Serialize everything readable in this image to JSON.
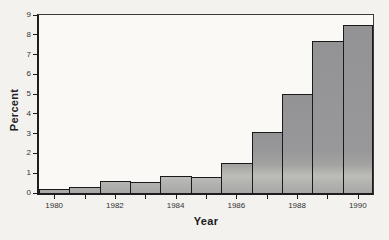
{
  "chart_data": {
    "type": "bar",
    "title": "",
    "xlabel": "Year",
    "ylabel": "Percent",
    "categories": [
      "1980",
      "1981",
      "1982",
      "1983",
      "1984",
      "1985",
      "1986",
      "1987",
      "1988",
      "1989",
      "1990"
    ],
    "values": [
      0.2,
      0.3,
      0.6,
      0.55,
      0.85,
      0.8,
      1.5,
      3.1,
      5.0,
      7.7,
      8.5
    ],
    "ylim": [
      0,
      9
    ],
    "yticks": [
      "0",
      "1",
      "2",
      "3",
      "4",
      "5",
      "6",
      "7",
      "8",
      "9"
    ],
    "xtick_labeled_years": [
      "1980",
      "1982",
      "1984",
      "1986",
      "1988",
      "1990"
    ],
    "grid": false,
    "legend": "none",
    "colors": {
      "bar_fill": "#9c9c9e",
      "bar_light_band": "#bdbdb8",
      "bar_border": "#1a1a1a",
      "axis": "#1d1d1d",
      "background": "#f3f2ef",
      "plot_background": "#faf9f6",
      "tick_text": "#333333"
    }
  }
}
